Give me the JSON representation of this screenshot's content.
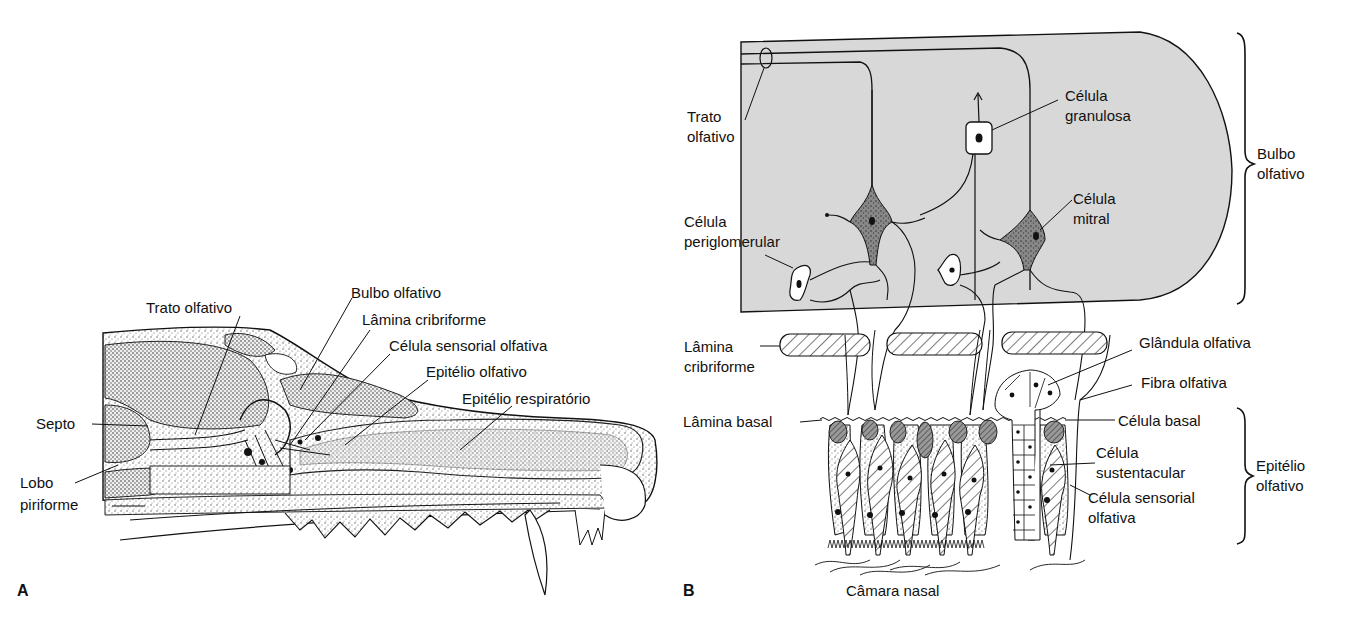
{
  "figure": {
    "panel_a": {
      "letter": "A",
      "labels": {
        "trato_olfativo": "Trato olfativo",
        "bulbo_olfativo": "Bulbo olfativo",
        "lamina_cribriforme": "Lâmina cribriforme",
        "celula_sensorial_olfativa": "Célula sensorial olfativa",
        "epitelio_olfativo": "Epitélio olfativo",
        "epitelio_respiratorio": "Epitélio respiratório",
        "septo": "Septo",
        "lobo_piriforme_1": "Lobo",
        "lobo_piriforme_2": "piriforme"
      }
    },
    "panel_b": {
      "letter": "B",
      "labels": {
        "trato_olfativo_1": "Trato",
        "trato_olfativo_2": "olfativo",
        "celula_granulosa_1": "Célula",
        "celula_granulosa_2": "granulosa",
        "celula_mitral_1": "Célula",
        "celula_mitral_2": "mitral",
        "celula_periglomerular_1": "Célula",
        "celula_periglomerular_2": "periglomerular",
        "bulbo_olfativo_1": "Bulbo",
        "bulbo_olfativo_2": "olfativo",
        "lamina_cribriforme_1": "Lâmina",
        "lamina_cribriforme_2": "cribriforme",
        "glandula_olfativa": "Glândula olfativa",
        "fibra_olfativa": "Fibra olfativa",
        "lamina_basal": "Lâmina basal",
        "celula_basal": "Célula basal",
        "celula_sustentacular_1": "Célula",
        "celula_sustentacular_2": "sustentacular",
        "celula_sensorial_olfativa_1": "Célula sensorial",
        "celula_sensorial_olfativa_2": "olfativa",
        "epitelio_olfativo_1": "Epitélio",
        "epitelio_olfativo_2": "olfativo",
        "camara_nasal": "Câmara nasal"
      }
    },
    "colors": {
      "background": "#ffffff",
      "bulb_fill": "#d8d8d8",
      "ink": "#111111",
      "stipple": "#444444"
    }
  }
}
